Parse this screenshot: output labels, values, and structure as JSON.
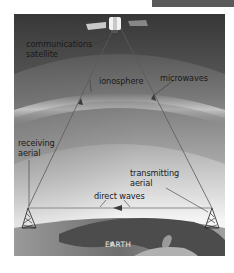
{
  "diagram": {
    "type": "satellite communications diagram",
    "labels": {
      "satellite_line1": "communications",
      "satellite_line2": "satellite",
      "ionosphere": "ionosphere",
      "microwaves": "microwaves",
      "receiving_line1": "receiving",
      "receiving_line2": "aerial",
      "transmitting_line1": "transmitting",
      "transmitting_line2": "aerial",
      "direct_waves": "direct waves",
      "earth": "EARTH"
    },
    "colors": {
      "sky_top": "#3a3a3a",
      "sky_mid": "#8a8a8a",
      "sky_bottom": "#f2f2f2",
      "ionosphere_band": "#b8b8b8",
      "earth_dark": "#4a4a4a",
      "earth_land": "#8e8e8e",
      "wave_line": "#6a6a6a"
    }
  }
}
